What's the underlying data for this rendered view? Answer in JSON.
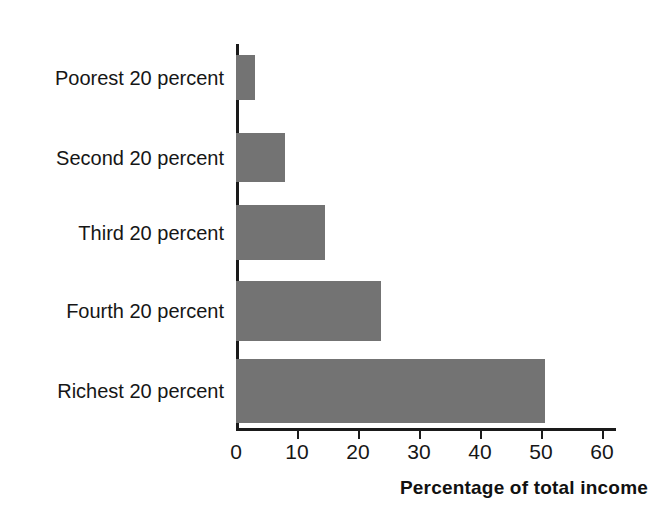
{
  "chart_data": {
    "type": "bar",
    "orientation": "horizontal",
    "title": "",
    "xlabel": "Percentage of total income",
    "ylabel": "",
    "categories": [
      "Poorest 20 percent",
      "Second 20 percent",
      "Third 20 percent",
      "Fourth 20 percent",
      "Richest 20 percent"
    ],
    "values": [
      3.1,
      8.0,
      14.6,
      23.8,
      50.6
    ],
    "xlim": [
      0,
      65
    ],
    "xticks": [
      0,
      10,
      20,
      30,
      40,
      50,
      60
    ],
    "xtick_labels": [
      "0",
      "10",
      "20",
      "30",
      "40",
      "50",
      "60"
    ],
    "grid": false,
    "legend": false,
    "bar_color": "#737373",
    "axis_color": "#1a1a1a",
    "text_color": "#161616",
    "background": "#ffffff"
  }
}
